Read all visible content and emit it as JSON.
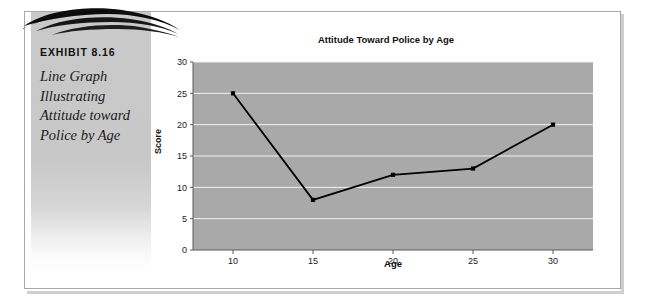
{
  "exhibit": {
    "label": "EXHIBIT 8.16",
    "caption": "Line Graph Illustrating Attitude toward Police by Age",
    "decoration_icon": "swoosh-wave-icon",
    "panel_color": "#c8c8c8",
    "frame_border_color": "#a8a8a8"
  },
  "chart_data": {
    "type": "line",
    "title": "Attitude Toward Police by Age",
    "xlabel": "Age",
    "ylabel": "Score",
    "x": [
      10,
      15,
      20,
      25,
      30
    ],
    "values": [
      25,
      8,
      12,
      13,
      20
    ],
    "series": [
      {
        "name": "Score",
        "values": [
          25,
          8,
          12,
          13,
          20
        ]
      }
    ],
    "xticks": [
      10,
      15,
      20,
      25,
      30
    ],
    "yticks": [
      0,
      5,
      10,
      15,
      20,
      25,
      30
    ],
    "xlim": [
      7.5,
      32.5
    ],
    "ylim": [
      0,
      30
    ],
    "grid": "horizontal",
    "legend": "none",
    "plot_background": "#a9a9a9",
    "gridline_color": "#f2f2f2",
    "line_color": "#000000",
    "marker": "square"
  }
}
